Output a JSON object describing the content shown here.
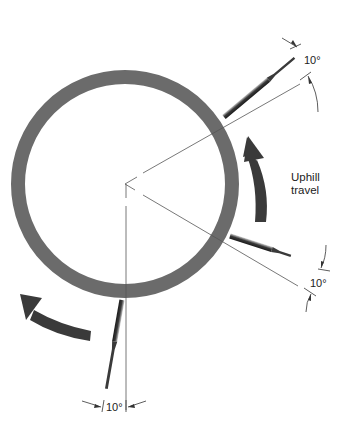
{
  "diagram": {
    "type": "rotating workpiece with tool positions",
    "labels": {
      "angle_top": "10°",
      "angle_right": "10°",
      "angle_bottom": "10°",
      "uphill_line1": "Uphill",
      "uphill_line2": "travel"
    },
    "colors": {
      "ring": "#6b6b6b",
      "arrow": "#3a3a3a",
      "line": "#555555",
      "tool_dark": "#2a2a2a",
      "tool_light": "#9a9a9a"
    },
    "elements": [
      "workpiece-ring",
      "center-reference-lines",
      "tool-top-right",
      "tool-lower-right",
      "tool-bottom",
      "uphill-travel-arrow",
      "rotation-arrow-lower-left"
    ]
  }
}
